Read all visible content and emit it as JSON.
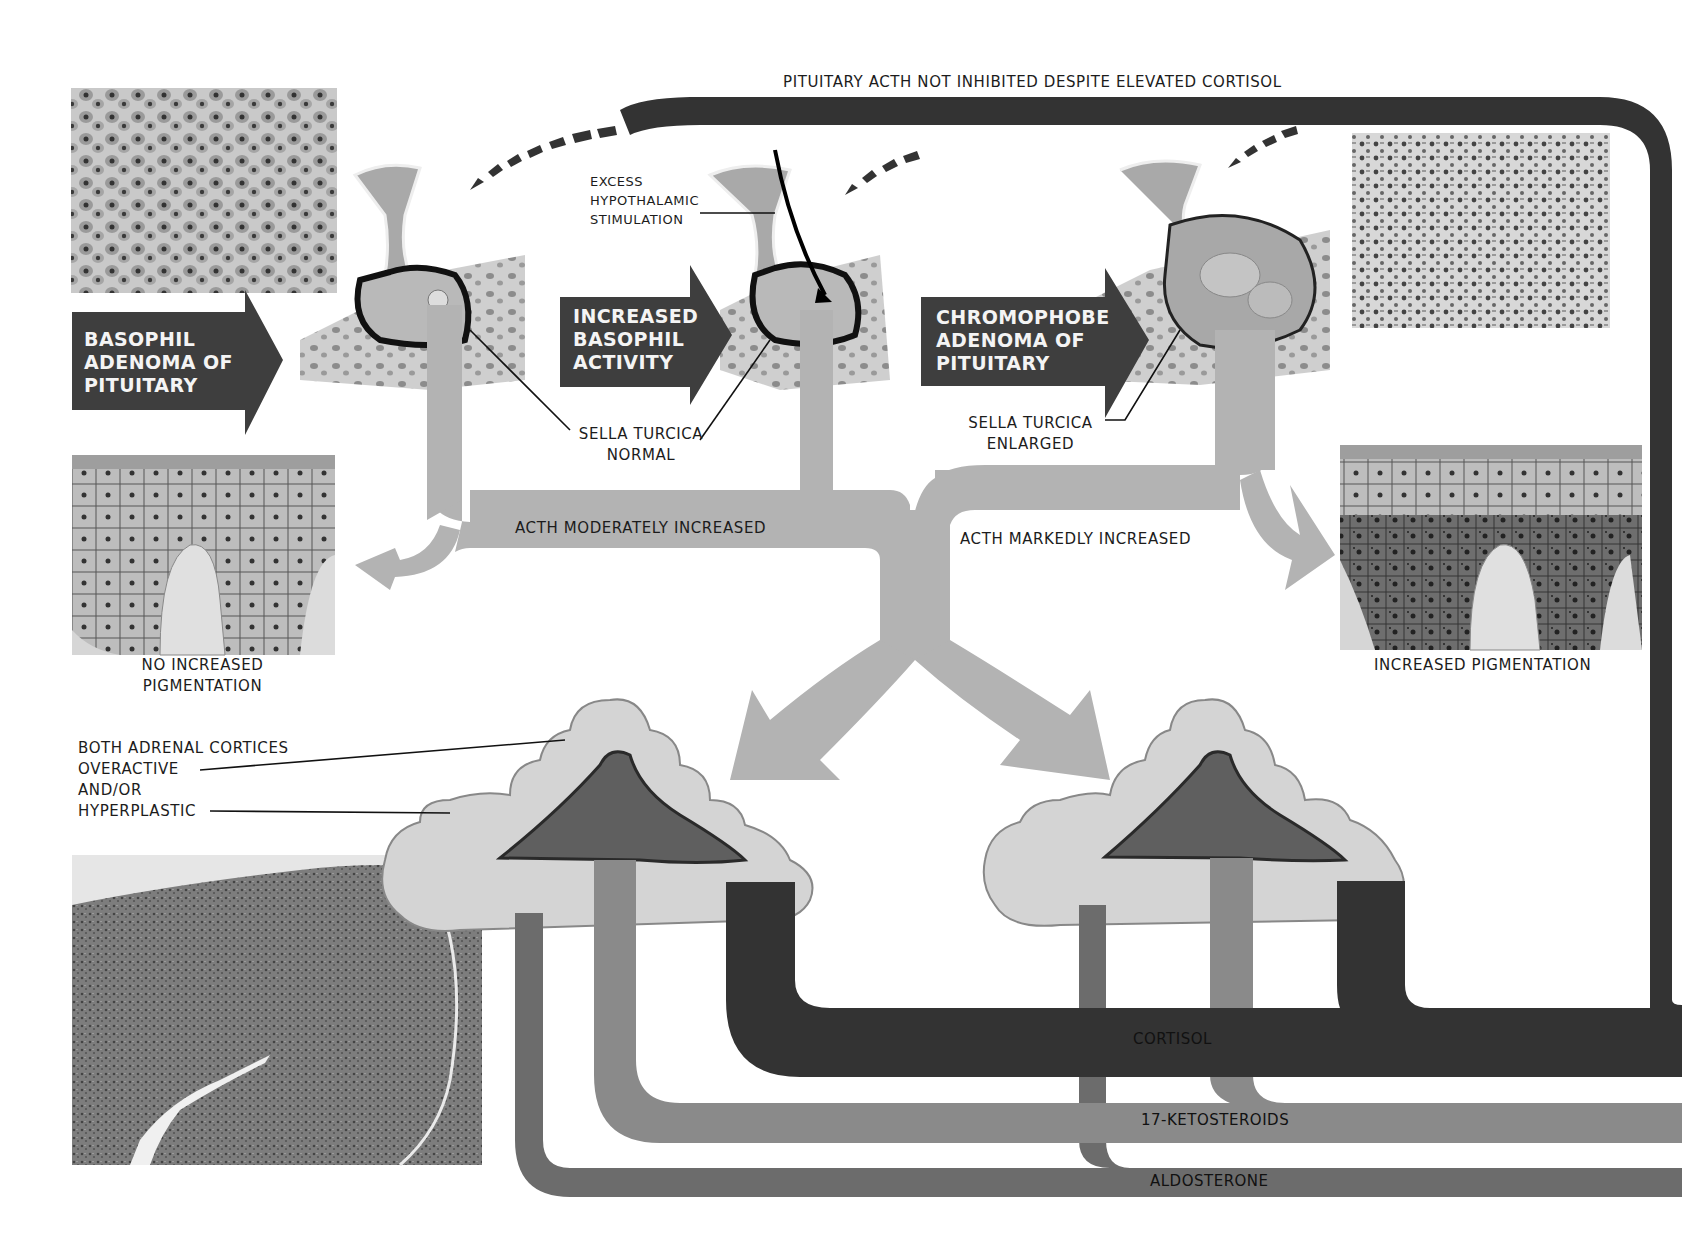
{
  "diagram": {
    "feedback_label": "PITUITARY ACTH NOT INHIBITED DESPITE ELEVATED CORTISOL",
    "causes": [
      {
        "id": "basophil-adenoma",
        "label_lines": [
          "BASOPHIL",
          "ADENOMA OF",
          "PITUITARY"
        ]
      },
      {
        "id": "increased-basophil-activity",
        "label_lines": [
          "INCREASED",
          "BASOPHIL",
          "ACTIVITY"
        ]
      },
      {
        "id": "chromophobe-adenoma",
        "label_lines": [
          "CHROMOPHOBE",
          "ADENOMA OF",
          "PITUITARY"
        ]
      }
    ],
    "annotations": {
      "hypothalamic": [
        "EXCESS",
        "HYPOTHALAMIC",
        "STIMULATION"
      ],
      "sella_normal": [
        "SELLA TURCICA",
        "NORMAL"
      ],
      "sella_enlarged": [
        "SELLA TURCICA",
        "ENLARGED"
      ],
      "acth_moderate": "ACTH MODERATELY INCREASED",
      "acth_marked": "ACTH MARKEDLY INCREASED",
      "no_pigmentation": [
        "NO INCREASED",
        "PIGMENTATION"
      ],
      "pigmentation": "INCREASED PIGMENTATION",
      "adrenal": [
        "BOTH ADRENAL CORTICES",
        "OVERACTIVE",
        "AND/OR",
        "HYPERPLASTIC"
      ]
    },
    "hormones": [
      {
        "name": "CORTISOL",
        "color": "#333333"
      },
      {
        "name": "17-KETOSTEROIDS",
        "color": "#8a8a8a"
      },
      {
        "name": "ALDOSTERONE",
        "color": "#6c6c6c"
      }
    ],
    "colors": {
      "acth_flow": "#b3b3b3",
      "cortisol": "#333333",
      "ketosteroids": "#8a8a8a",
      "aldosterone": "#6c6c6c",
      "label_box": "#3e3e3e",
      "adrenal_cortex": "#d4d4d4",
      "adrenal_medulla": "#5f5f5f"
    }
  }
}
